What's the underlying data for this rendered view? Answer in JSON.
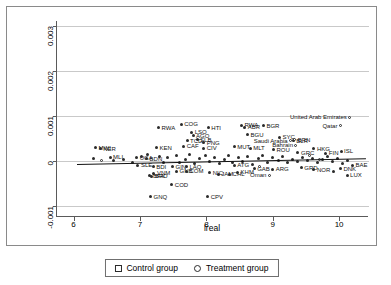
{
  "chart_data": {
    "type": "scatter",
    "title": "",
    "xlabel": "lreal",
    "ylabel": "",
    "xlim": [
      5.75,
      10.45
    ],
    "ylim": [
      -0.00125,
      0.0031
    ],
    "xticks": [
      "6",
      "7",
      "8",
      "9",
      "10"
    ],
    "xtick_values": [
      6,
      7,
      8,
      9,
      10
    ],
    "yticks": [
      "-0.001",
      "0",
      "0.001",
      "0.002",
      "0.003"
    ],
    "ytick_values": [
      -0.001,
      0,
      0.001,
      0.002,
      0.003
    ],
    "grid": "horizontal",
    "legend_position": "bottom-center",
    "legend": [
      {
        "label": "Control group",
        "marker": "square"
      },
      {
        "label": "Treatment group",
        "marker": "circle"
      }
    ],
    "fit_line": {
      "x0": 6.05,
      "y0": -7.5e-05,
      "x1": 10.4,
      "y1": 5.5e-05
    },
    "series": [
      {
        "name": "Control group",
        "marker": "filled-circle",
        "points": [
          {
            "label": "RWA",
            "x": 7.28,
            "y": 0.00073,
            "lp": "right"
          },
          {
            "label": "COG",
            "x": 7.62,
            "y": 0.00081,
            "lp": "right"
          },
          {
            "label": "HTI",
            "x": 8.03,
            "y": 0.00073,
            "lp": "right"
          },
          {
            "label": "RWA",
            "x": 8.53,
            "y": 0.00079,
            "lp": "right"
          },
          {
            "label": "BGR",
            "x": 8.86,
            "y": 0.00078,
            "lp": "right"
          },
          {
            "label": "ABR",
            "x": 8.58,
            "y": 0.00074,
            "lp": "right"
          },
          {
            "label": "LSO",
            "x": 7.78,
            "y": 0.00063,
            "lp": "right"
          },
          {
            "label": "AGO",
            "x": 7.8,
            "y": 0.00055,
            "lp": "right"
          },
          {
            "label": "BGU",
            "x": 8.62,
            "y": 0.00058,
            "lp": "right"
          },
          {
            "label": "SLB",
            "x": 7.86,
            "y": 0.00047,
            "lp": "right"
          },
          {
            "label": "TCD",
            "x": 7.71,
            "y": 0.00044,
            "lp": "right"
          },
          {
            "label": "PNG",
            "x": 7.96,
            "y": 0.0004,
            "lp": "right"
          },
          {
            "label": "SYC",
            "x": 9.1,
            "y": 0.00052,
            "lp": "right"
          },
          {
            "label": "BLR",
            "x": 9.31,
            "y": 0.00044,
            "lp": "right"
          },
          {
            "label": "CAF",
            "x": 7.66,
            "y": 0.00032,
            "lp": "right"
          },
          {
            "label": "CIV",
            "x": 7.96,
            "y": 0.00028,
            "lp": "right"
          },
          {
            "label": "MUT",
            "x": 8.42,
            "y": 0.00031,
            "lp": "right"
          },
          {
            "label": "MLT",
            "x": 8.66,
            "y": 0.00028,
            "lp": "right"
          },
          {
            "label": "KEN",
            "x": 7.25,
            "y": 0.00029,
            "lp": "right"
          },
          {
            "label": "ROU",
            "x": 9.01,
            "y": 0.00024,
            "lp": "right"
          },
          {
            "label": "HKG",
            "x": 9.62,
            "y": 0.00026,
            "lp": "right"
          },
          {
            "label": "ISL",
            "x": 10.03,
            "y": 0.00021,
            "lp": "right"
          },
          {
            "label": "MWI",
            "x": 6.33,
            "y": 0.00029,
            "lp": "right"
          },
          {
            "label": "NER",
            "x": 6.4,
            "y": 0.00027,
            "lp": "right"
          },
          {
            "label": "MLI",
            "x": 6.55,
            "y": 8e-05,
            "lp": "right"
          },
          {
            "label": "UGA",
            "x": 6.95,
            "y": 6e-05,
            "lp": "right"
          },
          {
            "label": "BDN",
            "x": 7.1,
            "y": 4e-05,
            "lp": "right"
          },
          {
            "label": "SLE",
            "x": 6.97,
            "y": -0.0001,
            "lp": "right"
          },
          {
            "label": "BDI",
            "x": 7.2,
            "y": -0.00013,
            "lp": "right"
          },
          {
            "label": "GIN",
            "x": 7.49,
            "y": -0.00014,
            "lp": "right"
          },
          {
            "label": "LAO",
            "x": 7.7,
            "y": -0.00013,
            "lp": "right"
          },
          {
            "label": "GNB",
            "x": 7.55,
            "y": -0.00023,
            "lp": "right"
          },
          {
            "label": "COM",
            "x": 7.7,
            "y": -0.00024,
            "lp": "right"
          },
          {
            "label": "VNM",
            "x": 7.21,
            "y": -0.00028,
            "lp": "right"
          },
          {
            "label": "BFA",
            "x": 7.15,
            "y": -0.00033,
            "lp": "right"
          },
          {
            "label": "BRD",
            "x": 7.18,
            "y": -0.00035,
            "lp": "right"
          },
          {
            "label": "JAM",
            "x": 8.18,
            "y": -0.0003,
            "lp": "right"
          },
          {
            "label": "COD",
            "x": 7.48,
            "y": -0.00053,
            "lp": "right"
          },
          {
            "label": "GNQ",
            "x": 7.16,
            "y": -0.0008,
            "lp": "right"
          },
          {
            "label": "CPV",
            "x": 8.02,
            "y": -0.0008,
            "lp": "right"
          },
          {
            "label": "NIC",
            "x": 8.05,
            "y": -0.00027,
            "lp": "right"
          },
          {
            "label": "CHL",
            "x": 8.35,
            "y": -0.0003,
            "lp": "right"
          },
          {
            "label": "KHM",
            "x": 8.47,
            "y": -0.00026,
            "lp": "right"
          },
          {
            "label": "ATG",
            "x": 8.42,
            "y": -0.0001,
            "lp": "right"
          },
          {
            "label": "GAB",
            "x": 8.72,
            "y": -0.00018,
            "lp": "right"
          },
          {
            "label": "ARG",
            "x": 9.0,
            "y": -0.00019,
            "lp": "right"
          },
          {
            "label": "GRD",
            "x": 9.43,
            "y": -0.00016,
            "lp": "right"
          },
          {
            "label": "NOR",
            "x": 9.62,
            "y": -0.0002,
            "lp": "right"
          },
          {
            "label": "GRC",
            "x": 9.38,
            "y": 0.00018,
            "lp": "right"
          },
          {
            "label": "FIN",
            "x": 9.8,
            "y": 0.00016,
            "lp": "right"
          },
          {
            "label": "BAE",
            "x": 10.2,
            "y": -0.0001,
            "lp": "right"
          },
          {
            "label": "DNK",
            "x": 10.02,
            "y": -0.00018,
            "lp": "right"
          },
          {
            "label": "LUX",
            "x": 10.12,
            "y": -0.00032,
            "lp": "right"
          },
          {
            "label": "NIC2",
            "x": 9.92,
            "y": -0.00024,
            "lp": "right"
          },
          {
            "label": "",
            "x": 6.3,
            "y": 4e-05,
            "lp": "right"
          },
          {
            "label": "",
            "x": 6.6,
            "y": 0.0,
            "lp": "right"
          },
          {
            "label": "",
            "x": 6.75,
            "y": 3e-05,
            "lp": "right"
          },
          {
            "label": "",
            "x": 6.88,
            "y": -4e-05,
            "lp": "right"
          },
          {
            "label": "",
            "x": 7.02,
            "y": 0.0001,
            "lp": "right"
          },
          {
            "label": "",
            "x": 7.12,
            "y": 0.00013,
            "lp": "right"
          },
          {
            "label": "",
            "x": 7.3,
            "y": 9e-05,
            "lp": "right"
          },
          {
            "label": "",
            "x": 7.35,
            "y": -3e-05,
            "lp": "right"
          },
          {
            "label": "",
            "x": 7.42,
            "y": 6e-05,
            "lp": "right"
          },
          {
            "label": "",
            "x": 7.55,
            "y": 0.00011,
            "lp": "right"
          },
          {
            "label": "",
            "x": 7.6,
            "y": -5e-05,
            "lp": "right"
          },
          {
            "label": "",
            "x": 7.68,
            "y": 2e-05,
            "lp": "right"
          },
          {
            "label": "",
            "x": 7.74,
            "y": 0.00013,
            "lp": "right"
          },
          {
            "label": "",
            "x": 7.82,
            "y": -7e-05,
            "lp": "right"
          },
          {
            "label": "",
            "x": 7.9,
            "y": 5e-05,
            "lp": "right"
          },
          {
            "label": "",
            "x": 7.98,
            "y": 0.00012,
            "lp": "right"
          },
          {
            "label": "",
            "x": 8.05,
            "y": -2e-05,
            "lp": "right"
          },
          {
            "label": "",
            "x": 8.12,
            "y": 8e-05,
            "lp": "right"
          },
          {
            "label": "",
            "x": 8.2,
            "y": -6e-05,
            "lp": "right"
          },
          {
            "label": "",
            "x": 8.28,
            "y": 3e-05,
            "lp": "right"
          },
          {
            "label": "",
            "x": 8.34,
            "y": 0.00011,
            "lp": "right"
          },
          {
            "label": "",
            "x": 8.4,
            "y": -4e-05,
            "lp": "right"
          },
          {
            "label": "",
            "x": 8.48,
            "y": 7e-05,
            "lp": "right"
          },
          {
            "label": "",
            "x": 8.55,
            "y": -1e-05,
            "lp": "right"
          },
          {
            "label": "",
            "x": 8.62,
            "y": 9e-05,
            "lp": "right"
          },
          {
            "label": "",
            "x": 8.7,
            "y": -8e-05,
            "lp": "right"
          },
          {
            "label": "",
            "x": 8.78,
            "y": 4e-05,
            "lp": "right"
          },
          {
            "label": "",
            "x": 8.85,
            "y": 0.00012,
            "lp": "right"
          },
          {
            "label": "",
            "x": 8.92,
            "y": -3e-05,
            "lp": "right"
          },
          {
            "label": "",
            "x": 9.0,
            "y": 6e-05,
            "lp": "right"
          },
          {
            "label": "",
            "x": 9.08,
            "y": 1e-05,
            "lp": "right"
          },
          {
            "label": "",
            "x": 9.15,
            "y": 0.0001,
            "lp": "right"
          },
          {
            "label": "",
            "x": 9.22,
            "y": -5e-05,
            "lp": "right"
          },
          {
            "label": "",
            "x": 9.3,
            "y": 3e-05,
            "lp": "right"
          },
          {
            "label": "",
            "x": 9.38,
            "y": -2e-05,
            "lp": "right"
          },
          {
            "label": "",
            "x": 9.45,
            "y": 8e-05,
            "lp": "right"
          },
          {
            "label": "",
            "x": 9.52,
            "y": 0.0,
            "lp": "right"
          },
          {
            "label": "",
            "x": 9.6,
            "y": 5e-05,
            "lp": "right"
          },
          {
            "label": "",
            "x": 9.68,
            "y": -4e-05,
            "lp": "right"
          },
          {
            "label": "",
            "x": 9.75,
            "y": 2e-05,
            "lp": "right"
          },
          {
            "label": "",
            "x": 9.82,
            "y": 9e-05,
            "lp": "right"
          },
          {
            "label": "",
            "x": 9.9,
            "y": -1e-05,
            "lp": "right"
          },
          {
            "label": "",
            "x": 9.97,
            "y": 4e-05,
            "lp": "right"
          },
          {
            "label": "",
            "x": 10.05,
            "y": -6e-05,
            "lp": "right"
          },
          {
            "label": "",
            "x": 10.12,
            "y": 1e-05,
            "lp": "right"
          }
        ]
      },
      {
        "name": "Treatment group",
        "marker": "open-circle",
        "points": [
          {
            "label": "United Arab Emirates",
            "x": 10.16,
            "y": 0.00096,
            "lp": "left"
          },
          {
            "label": "Qatar",
            "x": 10.02,
            "y": 0.00078,
            "lp": "left"
          },
          {
            "label": "Saudi Arabia",
            "x": 9.27,
            "y": 0.00044,
            "lp": "left"
          },
          {
            "label": "Bahrain",
            "x": 9.35,
            "y": 0.00034,
            "lp": "left"
          },
          {
            "label": "Oman",
            "x": 8.95,
            "y": -0.00032,
            "lp": "left"
          },
          {
            "label": "BRN",
            "x": 9.33,
            "y": 0.00046,
            "lp": "right"
          },
          {
            "label": "",
            "x": 9.55,
            "y": 0.00012,
            "lp": "right"
          },
          {
            "label": "",
            "x": 9.7,
            "y": 2e-05,
            "lp": "right"
          },
          {
            "label": "",
            "x": 8.8,
            "y": -0.00012,
            "lp": "right"
          },
          {
            "label": "",
            "x": 6.42,
            "y": 1e-05,
            "lp": "right"
          }
        ]
      }
    ]
  }
}
